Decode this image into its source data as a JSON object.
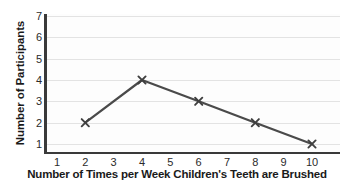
{
  "chart_data": {
    "type": "line",
    "title": "",
    "xlabel": "Number of Times per Week Children's Teeth are Brushed",
    "ylabel": "Number of Participants",
    "x": [
      2,
      4,
      6,
      8,
      10
    ],
    "values": [
      2,
      4,
      3,
      2,
      1
    ],
    "series": [
      {
        "name": "Participants",
        "x": [
          2,
          4,
          6,
          8,
          10
        ],
        "values": [
          2,
          4,
          3,
          2,
          1
        ]
      }
    ],
    "xlim": [
      1,
      10
    ],
    "ylim": [
      1,
      7
    ],
    "x_ticks": [
      "1",
      "2",
      "3",
      "4",
      "5",
      "6",
      "7",
      "8",
      "9",
      "10"
    ],
    "y_ticks": [
      "1",
      "2",
      "3",
      "4",
      "5",
      "6",
      "7"
    ],
    "grid": "horizontal",
    "legend": "none",
    "marker": "x-cross",
    "line_color": "#4a4a4a",
    "marker_color": "#3f3f3f",
    "gridline_color": "#e3e3e3",
    "axis_color": "#3a3a3a",
    "background_color": "#ffffff"
  }
}
